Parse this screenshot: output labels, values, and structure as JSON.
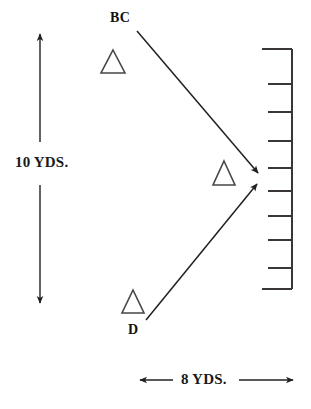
{
  "diagram": {
    "background_color": "#ffffff",
    "stroke_color": "#231f20",
    "labels": {
      "vertical_dimension": "10 YDS.",
      "horizontal_dimension": "8 YDS.",
      "player_bc": "BC",
      "player_d": "D"
    },
    "icons": {
      "defender_marker": "triangle-icon",
      "route_arrow": "arrow-icon",
      "dimension_arrow": "double-arrow-icon",
      "sideline_ladder": "ladder-scale-icon"
    },
    "markers": [
      {
        "name": "triangle-top",
        "apex_x": 113,
        "apex_y": 50,
        "half_width": 11,
        "height": 23
      },
      {
        "name": "triangle-middle",
        "apex_x": 224,
        "apex_y": 161,
        "half_width": 10,
        "height": 24
      },
      {
        "name": "triangle-bottom",
        "apex_x": 133,
        "apex_y": 290,
        "half_width": 10,
        "height": 23
      }
    ],
    "routes": [
      {
        "name": "route-bc",
        "from_x": 137,
        "from_y": 31,
        "to_x": 261,
        "to_y": 176
      },
      {
        "name": "route-d",
        "from_x": 146,
        "from_y": 320,
        "to_x": 260,
        "to_y": 181
      }
    ],
    "vertical_dimension_line": {
      "x": 40,
      "top_y": 31,
      "upper_end_y": 142,
      "lower_start_y": 185,
      "bottom_y": 306
    },
    "horizontal_dimension_line": {
      "y": 380,
      "left_x": 137,
      "left_end_x": 173,
      "right_start_x": 239,
      "right_x": 296
    },
    "ladder": {
      "spine_x": 292,
      "top_y": 49,
      "bottom_y": 289,
      "rail_left_x": 262,
      "tick_left_x": 268,
      "rung_y_values": [
        84,
        112,
        141,
        168,
        191,
        216,
        240,
        268
      ]
    }
  }
}
